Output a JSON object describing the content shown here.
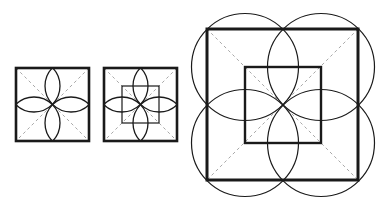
{
  "diagram": {
    "colors": {
      "stroke": "#1a1a1a",
      "dashed": "#a8a8a8",
      "background": "#ffffff"
    },
    "figures": [
      {
        "name": "figure-1",
        "outer_square": {
          "x": 16,
          "y": 68,
          "size": 73
        },
        "center": [
          52.5,
          104.5
        ],
        "arc_radius": 26,
        "arc_centers": [
          [
            34,
            86
          ],
          [
            71,
            86
          ],
          [
            34,
            123
          ],
          [
            71,
            123
          ]
        ],
        "show_inner_square": false
      },
      {
        "name": "figure-2",
        "outer_square": {
          "x": 104,
          "y": 68,
          "size": 73
        },
        "center": [
          140.5,
          104.5
        ],
        "arc_radius": 26,
        "arc_centers": [
          [
            122,
            86
          ],
          [
            159,
            86
          ],
          [
            122,
            123
          ],
          [
            159,
            123
          ]
        ],
        "show_inner_square": true,
        "inner_square": {
          "x": 122,
          "y": 86,
          "size": 37
        }
      },
      {
        "name": "figure-3",
        "outer_square": {
          "x": 207,
          "y": 29,
          "size": 151
        },
        "center": [
          283,
          105
        ],
        "circle_radius": 53.5,
        "circle_centers": [
          [
            245,
            67
          ],
          [
            321,
            67
          ],
          [
            245,
            143
          ],
          [
            321,
            143
          ]
        ],
        "inner_square": {
          "x": 245,
          "y": 67,
          "size": 76
        }
      }
    ]
  }
}
